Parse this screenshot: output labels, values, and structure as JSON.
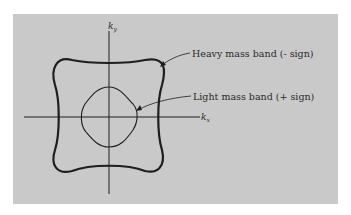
{
  "figure": {
    "axes": {
      "x_label": "k",
      "x_subscript": "x",
      "y_label": "k",
      "y_subscript": "y"
    },
    "curves": [
      {
        "name": "heavy-mass-band",
        "label": "Heavy mass band (- sign)",
        "stroke": "heavy"
      },
      {
        "name": "light-mass-band",
        "label": "Light mass band (+ sign)",
        "stroke": "light"
      }
    ],
    "colors": {
      "panel": "#c9c9c9",
      "ink": "#1e1e1e"
    }
  }
}
